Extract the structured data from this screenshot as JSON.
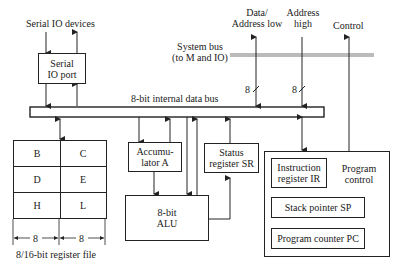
{
  "diagram": {
    "external_labels": {
      "serial_io_devices": "Serial IO devices",
      "data_address_low_line1": "Data/",
      "data_address_low_line2": "Address low",
      "address_high_line1": "Address",
      "address_high_line2": "high",
      "control": "Control",
      "system_bus_line1": "System bus",
      "system_bus_line2": "(to M and IO)",
      "internal_bus": "8-bit internal data bus",
      "bus_width_low": "8",
      "bus_width_high": "8"
    },
    "serial_io_port": {
      "line1": "Serial",
      "line2": "IO port"
    },
    "register_file": {
      "cells": [
        [
          "B",
          "C"
        ],
        [
          "D",
          "E"
        ],
        [
          "H",
          "L"
        ]
      ],
      "width_left": "8",
      "width_right": "8",
      "caption": "8/16-bit register file"
    },
    "accumulator": {
      "line1": "Accumu-",
      "line2": "lator A"
    },
    "alu": {
      "line1": "8-bit",
      "line2": "ALU"
    },
    "status_register": {
      "line1": "Status",
      "line2": "register SR"
    },
    "program_control": {
      "label_line1": "Program",
      "label_line2": "control",
      "instruction_register_line1": "Instruction",
      "instruction_register_line2": "register IR",
      "stack_pointer": "Stack pointer SP",
      "program_counter": "Program counter PC"
    },
    "colors": {
      "line": "#222222",
      "system_bus": "#bbbbbb"
    }
  }
}
